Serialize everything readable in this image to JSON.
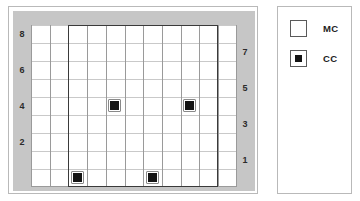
{
  "plot": {
    "axis_left": {
      "name": "left-axis",
      "ticks": [
        {
          "label": "8",
          "row_from_top": 0
        },
        {
          "label": "6",
          "row_from_top": 2
        },
        {
          "label": "4",
          "row_from_top": 4
        },
        {
          "label": "2",
          "row_from_top": 6
        }
      ]
    },
    "axis_right": {
      "name": "right-axis",
      "ticks": [
        {
          "label": "7",
          "row_from_top": 1
        },
        {
          "label": "5",
          "row_from_top": 3
        },
        {
          "label": "3",
          "row_from_top": 5
        },
        {
          "label": "1",
          "row_from_top": 7
        }
      ]
    },
    "grid": {
      "columns": 11,
      "rows": 9,
      "line_color": "#9a9a9a",
      "background_color": "#ffffff",
      "gutter_color": "#c6c6c6"
    },
    "boundary": {
      "name": "highlighted-region",
      "color": "#3a3a3a",
      "start_column": 3,
      "end_column": 10
    },
    "markers": [
      {
        "type": "CC",
        "col": 5,
        "row": 5
      },
      {
        "type": "CC",
        "col": 9,
        "row": 5
      },
      {
        "type": "CC",
        "col": 3,
        "row": 1
      },
      {
        "type": "CC",
        "col": 7,
        "row": 1
      }
    ],
    "marker_color": "#141414"
  },
  "legend": {
    "items": [
      {
        "label": "MC",
        "swatch": "empty-square",
        "color": "#ffffff"
      },
      {
        "label": "CC",
        "swatch": "square-with-dot",
        "color": "#141414"
      }
    ]
  }
}
